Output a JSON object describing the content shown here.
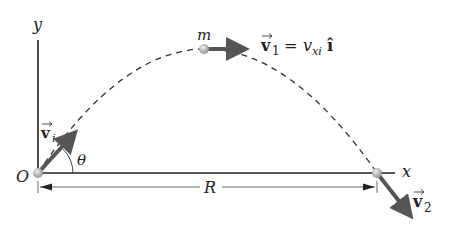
{
  "diagram": {
    "axes": {
      "y_label": "y",
      "x_label": "x",
      "origin_label": "O"
    },
    "angle_label": "θ",
    "range_label": "R",
    "mass_label": "m",
    "vectors": {
      "initial": {
        "symbol": "v",
        "subscript": "i"
      },
      "top": {
        "symbol": "v",
        "subscript": "1",
        "equals": "=",
        "rhs_var": "v",
        "rhs_sub": "xi",
        "unit": "î"
      },
      "final": {
        "symbol": "v",
        "subscript": "2"
      }
    },
    "colors": {
      "axis": "#222222",
      "arrow": "#555555",
      "ball": "#b0b0b0",
      "trajectory": "#333333"
    }
  }
}
